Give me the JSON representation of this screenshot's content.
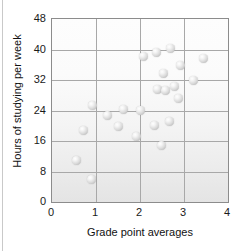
{
  "chart_data": {
    "type": "scatter",
    "title": "",
    "xlabel": "Grade point averages",
    "ylabel": "Hours of studying per week",
    "xlim": [
      0,
      4
    ],
    "ylim": [
      0,
      48
    ],
    "xticks": [
      0,
      1,
      2,
      3,
      4
    ],
    "yticks": [
      0,
      8,
      16,
      24,
      32,
      40,
      48
    ],
    "xtick_labels": [
      "0",
      "1",
      "2",
      "3",
      "4"
    ],
    "ytick_labels": [
      "0",
      "8",
      "16",
      "24",
      "32",
      "40",
      "48"
    ],
    "grid": true,
    "grid_axes": "both",
    "legend": false,
    "marker_style": "glossy-sphere",
    "marker_color": "#d9d9d9",
    "points": [
      {
        "x": 0.55,
        "y": 11.0
      },
      {
        "x": 0.72,
        "y": 18.7
      },
      {
        "x": 0.9,
        "y": 6.0
      },
      {
        "x": 0.93,
        "y": 25.2
      },
      {
        "x": 1.27,
        "y": 22.7
      },
      {
        "x": 1.52,
        "y": 19.8
      },
      {
        "x": 1.62,
        "y": 24.3
      },
      {
        "x": 1.93,
        "y": 17.3
      },
      {
        "x": 2.0,
        "y": 24.1
      },
      {
        "x": 2.07,
        "y": 38.2
      },
      {
        "x": 2.32,
        "y": 20.0
      },
      {
        "x": 2.37,
        "y": 39.3
      },
      {
        "x": 2.4,
        "y": 29.5
      },
      {
        "x": 2.48,
        "y": 14.9
      },
      {
        "x": 2.53,
        "y": 33.6
      },
      {
        "x": 2.57,
        "y": 29.2
      },
      {
        "x": 2.68,
        "y": 21.0
      },
      {
        "x": 2.7,
        "y": 40.2
      },
      {
        "x": 2.78,
        "y": 30.3
      },
      {
        "x": 2.87,
        "y": 27.2
      },
      {
        "x": 2.92,
        "y": 35.7
      },
      {
        "x": 3.22,
        "y": 31.8
      },
      {
        "x": 3.45,
        "y": 37.7
      }
    ]
  }
}
